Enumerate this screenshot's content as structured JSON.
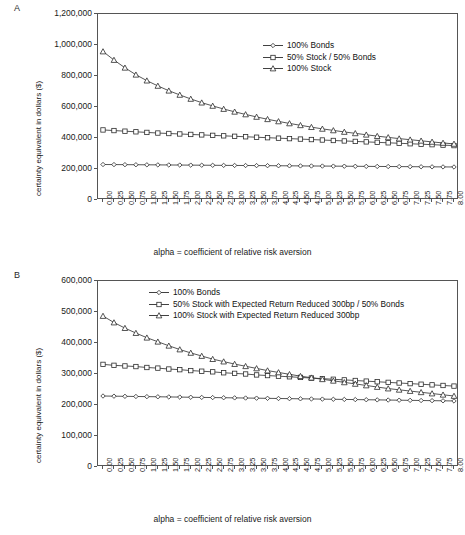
{
  "figure": {
    "panels": [
      {
        "letter": "A",
        "ylabel": "certainty equivalent in dollars ($)",
        "xlabel": "alpha = coefficient of relative risk aversion",
        "legend": [
          {
            "label": "100% Bonds",
            "marker": "diamond"
          },
          {
            "label": "50% Stock / 50% Bonds",
            "marker": "square"
          },
          {
            "label": "100% Stock",
            "marker": "triangle"
          }
        ],
        "yticks": [
          "0",
          "200,000",
          "400,000",
          "600,000",
          "800,000",
          "1,000,000",
          "1,200,000"
        ]
      },
      {
        "letter": "B",
        "ylabel": "certainty equivalent in dollars ($)",
        "xlabel": "alpha = coefficient of relative risk aversion",
        "legend": [
          {
            "label": "100% Bonds",
            "marker": "diamond"
          },
          {
            "label": "50% Stock with Expected Return Reduced 300bp / 50% Bonds",
            "marker": "square"
          },
          {
            "label": "100% Stock with Expected Return Reduced 300bp",
            "marker": "triangle"
          }
        ],
        "yticks": [
          "0",
          "100,000",
          "200,000",
          "300,000",
          "400,000",
          "500,000",
          "600,000"
        ]
      }
    ],
    "xticks": [
      "0.00",
      "0.25",
      "0.50",
      "0.75",
      "1.00",
      "1.25",
      "1.50",
      "1.75",
      "2.00",
      "2.25",
      "2.50",
      "2.75",
      "3.00",
      "3.25",
      "3.50",
      "3.75",
      "4.00",
      "4.25",
      "4.50",
      "4.75",
      "5.00",
      "5.25",
      "5.50",
      "5.75",
      "6.00",
      "6.25",
      "6.50",
      "6.75",
      "7.00",
      "7.25",
      "7.50",
      "7.75",
      "8.00"
    ]
  },
  "chart_data": [
    {
      "type": "line",
      "panel": "A",
      "title": "",
      "xlabel": "alpha = coefficient of relative risk aversion",
      "ylabel": "certainty equivalent in dollars ($)",
      "xlim": [
        0,
        8
      ],
      "ylim": [
        0,
        1200000
      ],
      "ytick_step": 200000,
      "xtick_step": 0.25,
      "grid": false,
      "legend_position": "upper right inside",
      "x": [
        0,
        0.25,
        0.5,
        0.75,
        1,
        1.25,
        1.5,
        1.75,
        2,
        2.25,
        2.5,
        2.75,
        3,
        3.25,
        3.5,
        3.75,
        4,
        4.25,
        4.5,
        4.75,
        5,
        5.25,
        5.5,
        5.75,
        6,
        6.25,
        6.5,
        6.75,
        7,
        7.25,
        7.5,
        7.75,
        8
      ],
      "series": [
        {
          "name": "100% Bonds",
          "marker": "diamond",
          "values": [
            229000,
            228500,
            228000,
            227500,
            227000,
            226500,
            226000,
            225500,
            225000,
            224500,
            224000,
            223500,
            223000,
            222500,
            222000,
            221500,
            221000,
            220500,
            220000,
            219500,
            219000,
            218500,
            218000,
            217500,
            217000,
            216500,
            216000,
            215500,
            215000,
            214500,
            214000,
            213500,
            213000
          ]
        },
        {
          "name": "50% Stock / 50% Bonds",
          "marker": "square",
          "values": [
            452000,
            448000,
            444000,
            440000,
            436000,
            432000,
            429000,
            426000,
            423000,
            420000,
            417000,
            414000,
            411000,
            408000,
            405000,
            402000,
            399000,
            396000,
            393000,
            390000,
            387000,
            384000,
            381000,
            378000,
            375000,
            372000,
            369000,
            366000,
            363000,
            360000,
            357000,
            354000,
            351000
          ]
        },
        {
          "name": "100% Stock",
          "marker": "triangle",
          "values": [
            958000,
            903000,
            853000,
            808000,
            770000,
            736000,
            705000,
            678000,
            652000,
            628000,
            607000,
            587000,
            569000,
            552000,
            536000,
            521000,
            507000,
            494000,
            482000,
            470000,
            459000,
            449000,
            439000,
            430000,
            421000,
            412000,
            404000,
            396000,
            389000,
            382000,
            375000,
            368000,
            362000
          ]
        }
      ]
    },
    {
      "type": "line",
      "panel": "B",
      "title": "",
      "xlabel": "alpha = coefficient of relative risk aversion",
      "ylabel": "certainty equivalent in dollars ($)",
      "xlim": [
        0,
        8
      ],
      "ylim": [
        0,
        600000
      ],
      "ytick_step": 100000,
      "xtick_step": 0.25,
      "grid": false,
      "legend_position": "upper right inside",
      "x": [
        0,
        0.25,
        0.5,
        0.75,
        1,
        1.25,
        1.5,
        1.75,
        2,
        2.25,
        2.5,
        2.75,
        3,
        3.25,
        3.5,
        3.75,
        4,
        4.25,
        4.5,
        4.75,
        5,
        5.25,
        5.5,
        5.75,
        6,
        6.25,
        6.5,
        6.75,
        7,
        7.25,
        7.5,
        7.75,
        8
      ],
      "series": [
        {
          "name": "100% Bonds",
          "marker": "diamond",
          "values": [
            229000,
            228500,
            228000,
            227500,
            227000,
            226500,
            226000,
            225500,
            225000,
            224500,
            224000,
            223500,
            223000,
            222500,
            222000,
            221500,
            221000,
            220500,
            220000,
            219500,
            219000,
            218500,
            218000,
            217500,
            217000,
            216500,
            216000,
            215500,
            215000,
            214500,
            214000,
            213500,
            213000
          ]
        },
        {
          "name": "50% Stock with Expected Return Reduced 300bp / 50% Bonds",
          "marker": "square",
          "values": [
            331000,
            328000,
            326000,
            324000,
            321000,
            319000,
            316000,
            314000,
            311000,
            309000,
            307000,
            304000,
            302000,
            300000,
            297000,
            295000,
            293000,
            291000,
            289000,
            287000,
            285000,
            283000,
            281000,
            279000,
            277000,
            275000,
            273000,
            271000,
            269000,
            267000,
            265000,
            263000,
            261000
          ]
        },
        {
          "name": "100% Stock with Expected Return Reduced 300bp",
          "marker": "triangle",
          "values": [
            487000,
            466000,
            448000,
            432000,
            417000,
            404000,
            391000,
            379000,
            368000,
            358000,
            348000,
            340000,
            332000,
            325000,
            318000,
            311000,
            305000,
            299000,
            293000,
            288000,
            283000,
            278000,
            273000,
            268000,
            263000,
            258000,
            253000,
            249000,
            245000,
            241000,
            237000,
            233000,
            229000
          ]
        }
      ]
    }
  ]
}
